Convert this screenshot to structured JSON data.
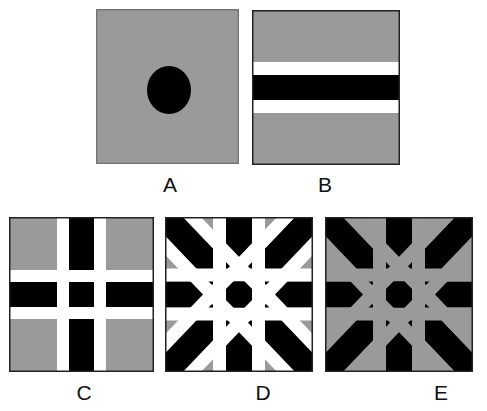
{
  "colors": {
    "gray": "#9a9a9a",
    "black": "#000000",
    "white": "#ffffff",
    "border": "#222222"
  },
  "panels": [
    {
      "id": "A",
      "label": "A",
      "description": "Gray square with a black circle (disk) in the center",
      "box": {
        "x": 96,
        "y": 9,
        "w": 143,
        "h": 155
      },
      "label_pos": {
        "x": 150,
        "y": 174
      },
      "circle": {
        "cx": 73,
        "cy": 81,
        "rx": 22,
        "ry": 24
      }
    },
    {
      "id": "B",
      "label": "B",
      "description": "Gray square with a horizontal black bar flanked by white bands",
      "box": {
        "x": 252,
        "y": 10,
        "w": 148,
        "h": 155
      },
      "label_pos": {
        "x": 305,
        "y": 174
      },
      "bar_width": 25,
      "flank_width": 13,
      "orientations": [
        0
      ]
    },
    {
      "id": "C",
      "label": "C",
      "description": "Gray square with crossing horizontal and vertical black bars flanked by white bands",
      "box": {
        "x": 9,
        "y": 217,
        "w": 145,
        "h": 155
      },
      "label_pos": {
        "x": 64,
        "y": 382
      },
      "bar_width": 25,
      "flank_width": 12,
      "orientations": [
        0,
        90
      ]
    },
    {
      "id": "D",
      "label": "D",
      "description": "Gray square with horizontal, vertical and two diagonal black bars flanked by white bands, black octagon at center",
      "box": {
        "x": 165,
        "y": 217,
        "w": 148,
        "h": 155
      },
      "label_pos": {
        "x": 243,
        "y": 382
      },
      "bar_width": 26,
      "flank_width": 13,
      "flank_color": "white",
      "orientations": [
        0,
        90,
        45,
        -45
      ]
    },
    {
      "id": "E",
      "label": "E",
      "description": "Same as D but the flanking bands are gray (same as background)",
      "box": {
        "x": 325,
        "y": 217,
        "w": 148,
        "h": 155
      },
      "label_pos": {
        "x": 421,
        "y": 382
      },
      "bar_width": 26,
      "flank_width": 13,
      "flank_color": "gray",
      "orientations": [
        0,
        90,
        45,
        -45
      ]
    }
  ]
}
